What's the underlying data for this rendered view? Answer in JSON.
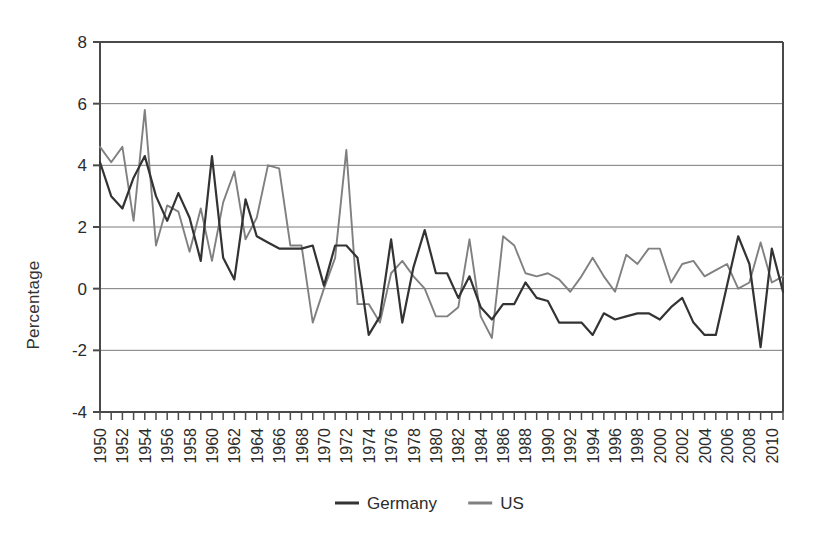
{
  "chart_data": {
    "type": "line",
    "title": "",
    "xlabel": "",
    "ylabel": "Percentage",
    "ylim": [
      -4,
      8
    ],
    "ytick_values": [
      -4,
      -2,
      0,
      2,
      4,
      6,
      8
    ],
    "ytick_labels": [
      "-4",
      "-2",
      "0",
      "2",
      "4",
      "6",
      "8"
    ],
    "xlim": [
      1950,
      2011
    ],
    "xtick_labels": [
      "1950",
      "1952",
      "1954",
      "1956",
      "1958",
      "1960",
      "1962",
      "1964",
      "1966",
      "1968",
      "1970",
      "1972",
      "1974",
      "1976",
      "1978",
      "1980",
      "1982",
      "1984",
      "1986",
      "1988",
      "1990",
      "1992",
      "1994",
      "1996",
      "1998",
      "2000",
      "2002",
      "2004",
      "2006",
      "2008",
      "2010"
    ],
    "xtick_label_rotation": -90,
    "x_minor_ticks_every": 1,
    "grid": "horizontal",
    "legend_position": "bottom",
    "x": [
      1950,
      1951,
      1952,
      1953,
      1954,
      1955,
      1956,
      1957,
      1958,
      1959,
      1960,
      1961,
      1962,
      1963,
      1964,
      1965,
      1966,
      1967,
      1968,
      1969,
      1970,
      1971,
      1972,
      1973,
      1974,
      1975,
      1976,
      1977,
      1978,
      1979,
      1980,
      1981,
      1982,
      1983,
      1984,
      1985,
      1986,
      1987,
      1988,
      1989,
      1990,
      1991,
      1992,
      1993,
      1994,
      1995,
      1996,
      1997,
      1998,
      1999,
      2000,
      2001,
      2002,
      2003,
      2004,
      2005,
      2006,
      2007,
      2008,
      2009,
      2010,
      2011
    ],
    "series": [
      {
        "name": "Germany",
        "color": "#333333",
        "values": [
          4.1,
          3.0,
          2.6,
          3.6,
          4.3,
          3.0,
          2.2,
          3.1,
          2.3,
          0.9,
          4.3,
          1.0,
          0.3,
          2.9,
          1.7,
          1.5,
          1.3,
          1.3,
          1.3,
          1.4,
          0.1,
          1.4,
          1.4,
          1.0,
          -1.5,
          -0.9,
          1.6,
          -1.1,
          0.7,
          1.9,
          0.5,
          0.5,
          -0.3,
          0.4,
          -0.6,
          -1.0,
          -0.5,
          -0.5,
          0.2,
          -0.3,
          -0.4,
          -1.1,
          -1.1,
          -1.1,
          -1.5,
          -0.8,
          -1.0,
          -0.9,
          -0.8,
          -0.8,
          -1.0,
          -0.6,
          -0.3,
          -1.1,
          -1.5,
          -1.5,
          0.1,
          1.7,
          0.8,
          -1.9,
          1.3,
          -0.1
        ]
      },
      {
        "name": "US",
        "color": "#808080",
        "values": [
          4.6,
          4.1,
          4.6,
          2.2,
          5.8,
          1.4,
          2.7,
          2.5,
          1.2,
          2.6,
          0.9,
          2.8,
          3.8,
          1.6,
          2.3,
          4.0,
          3.9,
          1.4,
          1.4,
          -1.1,
          0.0,
          1.0,
          4.5,
          -0.5,
          -0.5,
          -1.1,
          0.5,
          0.9,
          0.4,
          0.0,
          -0.9,
          -0.9,
          -0.6,
          1.6,
          -0.9,
          -1.6,
          1.7,
          1.4,
          0.5,
          0.4,
          0.5,
          0.3,
          -0.1,
          0.4,
          1.0,
          0.4,
          -0.1,
          1.1,
          0.8,
          1.3,
          1.3,
          0.2,
          0.8,
          0.9,
          0.4,
          0.6,
          0.8,
          0.0,
          0.2,
          1.5,
          0.2,
          0.4
        ]
      }
    ]
  },
  "legend": {
    "items": [
      {
        "label": "Germany",
        "color": "#333333"
      },
      {
        "label": "US",
        "color": "#808080"
      }
    ]
  },
  "axis": {
    "y_title": "Percentage"
  }
}
